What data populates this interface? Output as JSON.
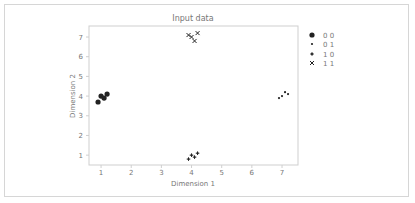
{
  "chart_data": {
    "type": "scatter",
    "title": "Input data",
    "xlabel": "Dimension 1",
    "ylabel": "Dimension 2",
    "xlim": [
      0.6,
      7.53
    ],
    "ylim": [
      0.5,
      7.56
    ],
    "xticks": [
      1,
      2,
      3,
      4,
      5,
      6,
      7
    ],
    "yticks": [
      1,
      2,
      3,
      4,
      5,
      6,
      7
    ],
    "grid": false,
    "legend_position": "outside right, upper",
    "series": [
      {
        "name": "0 0",
        "marker": "large-circle",
        "color": "#222222",
        "points": [
          [
            0.9,
            3.7
          ],
          [
            1.0,
            4.0
          ],
          [
            1.1,
            3.9
          ],
          [
            1.2,
            4.1
          ]
        ]
      },
      {
        "name": "0 1",
        "marker": "small-dot",
        "color": "#222222",
        "points": [
          [
            6.9,
            3.9
          ],
          [
            7.0,
            4.0
          ],
          [
            7.1,
            4.2
          ],
          [
            7.2,
            4.1
          ]
        ]
      },
      {
        "name": "1 0",
        "marker": "plus",
        "color": "#222222",
        "points": [
          [
            3.9,
            0.8
          ],
          [
            4.0,
            1.0
          ],
          [
            4.1,
            0.9
          ],
          [
            4.2,
            1.1
          ]
        ]
      },
      {
        "name": "1 1",
        "marker": "x",
        "color": "#222222",
        "points": [
          [
            3.9,
            7.1
          ],
          [
            4.0,
            7.0
          ],
          [
            4.1,
            6.8
          ],
          [
            4.2,
            7.2
          ]
        ]
      }
    ]
  },
  "colors": {
    "marker": "#222222",
    "axis": "#cfcfcf",
    "text": "#777777",
    "panel_border": "#d6d6d6"
  }
}
